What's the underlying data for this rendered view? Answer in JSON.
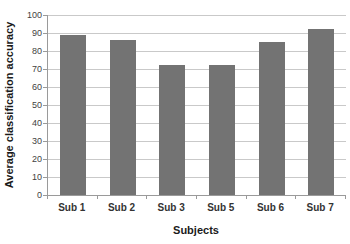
{
  "chart_data": {
    "type": "bar",
    "categories": [
      "Sub 1",
      "Sub 2",
      "Sub 3",
      "Sub 5",
      "Sub 6",
      "Sub 7"
    ],
    "values": [
      89,
      86,
      72.5,
      72.5,
      85,
      92.5
    ],
    "title": "",
    "xlabel": "Subjects",
    "ylabel": "Average classification accuracy",
    "ylim": [
      0,
      100
    ],
    "ytick_step": 10,
    "ytick_labels": [
      "0",
      "10",
      "20",
      "30",
      "40",
      "50",
      "60",
      "70",
      "80",
      "90",
      "100"
    ],
    "grid": true,
    "legend": "none",
    "bar_color": "#737373",
    "gridline_color": "#c9c9c9",
    "axis_color": "#9a9a9a",
    "tick_label_color": "#3f3f3f",
    "title_color": "#1a1a1a",
    "background_color": "#ffffff"
  }
}
